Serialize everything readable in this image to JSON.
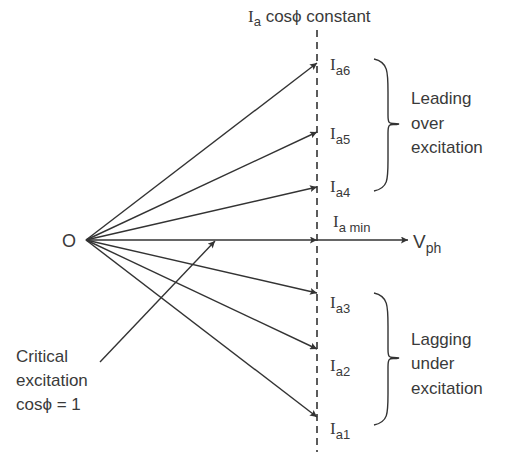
{
  "title": {
    "symbol": "I",
    "subscript": "a",
    "rest": " cosϕ constant"
  },
  "origin": {
    "label": "O",
    "x": 86,
    "y": 240
  },
  "dashed_line": {
    "x": 317,
    "y1": 22,
    "y2": 452
  },
  "reference": {
    "symbol": "V",
    "subscript": "ph",
    "tip_x": 408,
    "y": 240
  },
  "min_current": {
    "symbol": "I",
    "subscript": "a min"
  },
  "phasors": [
    {
      "symbol": "I",
      "subscript": "a6",
      "tip_y": 63
    },
    {
      "symbol": "I",
      "subscript": "a5",
      "tip_y": 132
    },
    {
      "symbol": "I",
      "subscript": "a4",
      "tip_y": 187
    },
    {
      "symbol": "I",
      "subscript": "a3",
      "tip_y": 293
    },
    {
      "symbol": "I",
      "subscript": "a2",
      "tip_y": 349
    },
    {
      "symbol": "I",
      "subscript": "a1",
      "tip_y": 417
    }
  ],
  "groups": {
    "leading": {
      "lines": [
        "Leading",
        "over",
        "excitation"
      ]
    },
    "lagging": {
      "lines": [
        "Lagging",
        "under",
        "excitation"
      ]
    }
  },
  "critical": {
    "lines": [
      "Critical",
      "excitation",
      "cosϕ = 1"
    ]
  },
  "colors": {
    "stroke": "#333333",
    "text": "#3a3a3a",
    "background": "#ffffff"
  }
}
